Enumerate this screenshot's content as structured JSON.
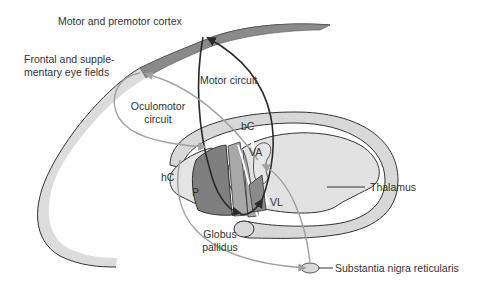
{
  "diagram": {
    "labels": {
      "motor_cortex": "Motor and premotor cortex",
      "eye_fields_line1": "Frontal and supple-",
      "eye_fields_line2": "mentary eye fields",
      "motor_circuit": "Motor circuit",
      "oculomotor_line1": "Oculomotor",
      "oculomotor_line2": "circuit",
      "bC": "bC",
      "hC": "hC",
      "P": "P",
      "VA": "VA",
      "VL": "VL",
      "globus_line1": "Globus",
      "globus_line2": "pallidus",
      "thalamus": "Thalamus",
      "snr": "Substantia nigra reticularis"
    },
    "colors": {
      "dark_gray": "#7a7a7a",
      "mid_gray": "#a5a5a5",
      "light_gray": "#dcdcdc",
      "stroke": "#333333",
      "light_arrow": "#a0a0a0"
    }
  }
}
